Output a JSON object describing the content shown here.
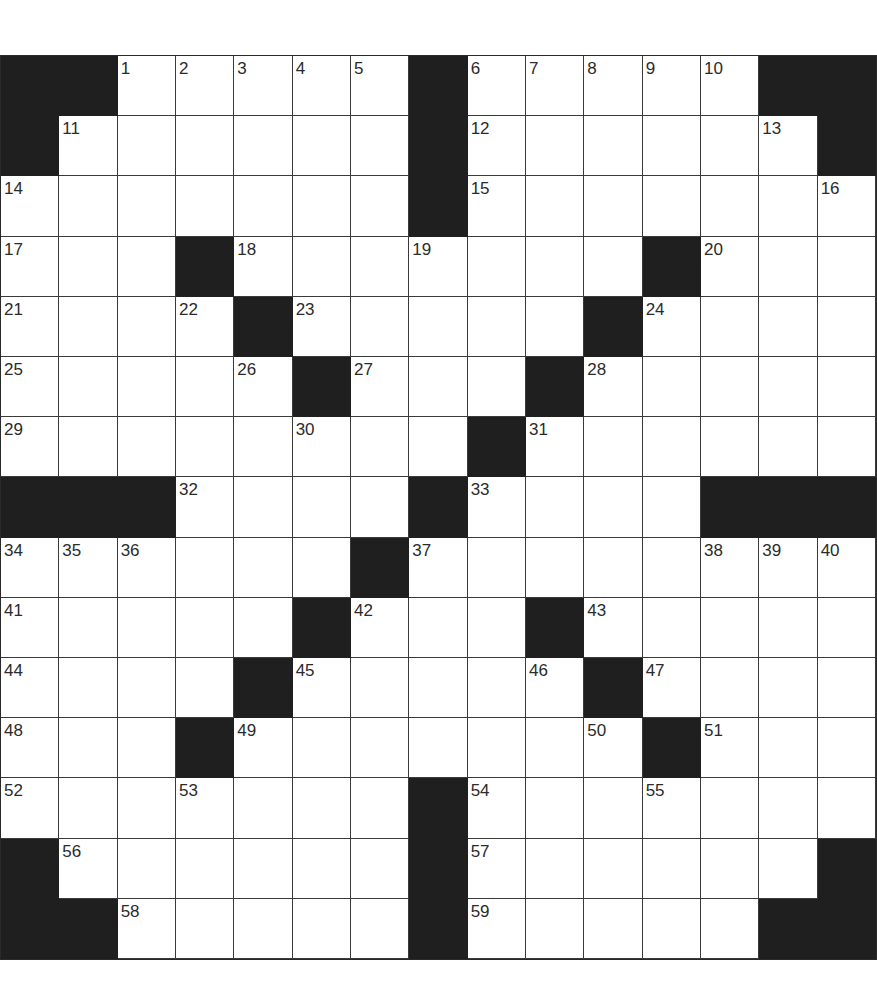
{
  "puzzle": {
    "rows": 15,
    "cols": 15,
    "colors": {
      "black": "#1f1f1f",
      "white": "#ffffff",
      "line": "#3a3a3a",
      "number": "#2b2b2b"
    },
    "grid": [
      [
        "#",
        "#",
        "1",
        "2",
        "3",
        "4",
        "5",
        "#",
        "6",
        "7",
        "8",
        "9",
        "10",
        "#",
        "#"
      ],
      [
        "#",
        "11",
        ".",
        ".",
        ".",
        ".",
        ".",
        "#",
        "12",
        ".",
        ".",
        ".",
        ".",
        "13",
        "#"
      ],
      [
        "14",
        ".",
        ".",
        ".",
        ".",
        ".",
        ".",
        "#",
        "15",
        ".",
        ".",
        ".",
        ".",
        ".",
        "16"
      ],
      [
        "17",
        ".",
        ".",
        "#",
        "18",
        ".",
        ".",
        "19",
        ".",
        ".",
        ".",
        "#",
        "20",
        ".",
        "."
      ],
      [
        "21",
        ".",
        ".",
        "22",
        "#",
        "23",
        ".",
        ".",
        ".",
        ".",
        "#",
        "24",
        ".",
        ".",
        "."
      ],
      [
        "25",
        ".",
        ".",
        ".",
        "26",
        "#",
        "27",
        ".",
        ".",
        "#",
        "28",
        ".",
        ".",
        ".",
        "."
      ],
      [
        "29",
        ".",
        ".",
        ".",
        ".",
        "30",
        ".",
        ".",
        "#",
        "31",
        ".",
        ".",
        ".",
        ".",
        "."
      ],
      [
        "#",
        "#",
        "#",
        "32",
        ".",
        ".",
        ".",
        "#",
        "33",
        ".",
        ".",
        ".",
        "#",
        "#",
        "#"
      ],
      [
        "34",
        "35",
        "36",
        ".",
        ".",
        ".",
        "#",
        "37",
        ".",
        ".",
        ".",
        ".",
        "38",
        "39",
        "40"
      ],
      [
        "41",
        ".",
        ".",
        ".",
        ".",
        "#",
        "42",
        ".",
        ".",
        "#",
        "43",
        ".",
        ".",
        ".",
        "."
      ],
      [
        "44",
        ".",
        ".",
        ".",
        "#",
        "45",
        ".",
        ".",
        ".",
        "46",
        "#",
        "47",
        ".",
        ".",
        "."
      ],
      [
        "48",
        ".",
        ".",
        "#",
        "49",
        ".",
        ".",
        ".",
        ".",
        ".",
        "50",
        "#",
        "51",
        ".",
        "."
      ],
      [
        "52",
        ".",
        ".",
        "53",
        ".",
        ".",
        ".",
        "#",
        "54",
        ".",
        ".",
        "55",
        ".",
        ".",
        "."
      ],
      [
        "#",
        "56",
        ".",
        ".",
        ".",
        ".",
        ".",
        "#",
        "57",
        ".",
        ".",
        ".",
        ".",
        ".",
        "#"
      ],
      [
        "#",
        "#",
        "58",
        ".",
        ".",
        ".",
        ".",
        "#",
        "59",
        ".",
        ".",
        ".",
        ".",
        "#",
        "#"
      ]
    ]
  }
}
